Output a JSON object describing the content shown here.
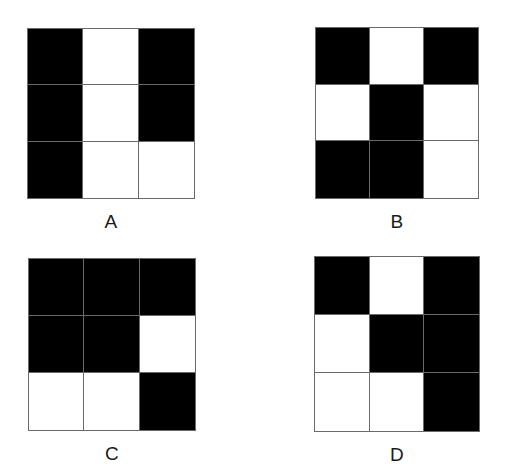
{
  "page": {
    "background_color": "#ffffff",
    "cell_black_color": "#000000",
    "cell_white_color": "#ffffff",
    "grid_line_color": "#6a6a6a",
    "label_color": "#1a1a1a"
  },
  "figures": [
    {
      "label": "A",
      "rows": 3,
      "columns": 3,
      "cells": [
        [
          "black",
          "white",
          "black"
        ],
        [
          "black",
          "white",
          "black"
        ],
        [
          "black",
          "white",
          "white"
        ]
      ],
      "flat_cells": [
        "black",
        "white",
        "black",
        "black",
        "white",
        "black",
        "black",
        "white",
        "white"
      ],
      "black_count": 5,
      "white_count": 4
    },
    {
      "label": "B",
      "rows": 3,
      "columns": 3,
      "cells": [
        [
          "black",
          "white",
          "black"
        ],
        [
          "white",
          "black",
          "white"
        ],
        [
          "black",
          "black",
          "white"
        ]
      ],
      "flat_cells": [
        "black",
        "white",
        "black",
        "white",
        "black",
        "white",
        "black",
        "black",
        "white"
      ],
      "black_count": 5,
      "white_count": 4
    },
    {
      "label": "C",
      "rows": 3,
      "columns": 3,
      "cells": [
        [
          "black",
          "black",
          "black"
        ],
        [
          "black",
          "black",
          "white"
        ],
        [
          "white",
          "white",
          "black"
        ]
      ],
      "flat_cells": [
        "black",
        "black",
        "black",
        "black",
        "black",
        "white",
        "white",
        "white",
        "black"
      ],
      "black_count": 6,
      "white_count": 3
    },
    {
      "label": "D",
      "rows": 3,
      "columns": 3,
      "cells": [
        [
          "black",
          "white",
          "black"
        ],
        [
          "white",
          "black",
          "black"
        ],
        [
          "white",
          "white",
          "black"
        ]
      ],
      "flat_cells": [
        "black",
        "white",
        "black",
        "white",
        "black",
        "black",
        "white",
        "white",
        "black"
      ],
      "black_count": 5,
      "white_count": 4
    }
  ]
}
